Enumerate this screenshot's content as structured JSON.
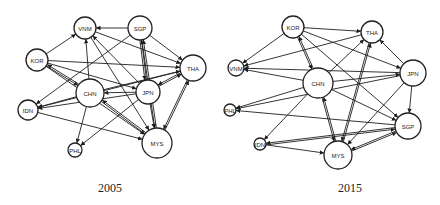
{
  "panels": [
    {
      "id": "p2005",
      "caption": "2005",
      "caption_pos": [
        110,
        192
      ],
      "nodes": [
        {
          "id": "VNM",
          "label": "VNM",
          "x": 85,
          "y": 28,
          "r": 11
        },
        {
          "id": "SGP",
          "label": "SGP",
          "x": 140,
          "y": 28,
          "r": 12
        },
        {
          "id": "KOR",
          "label": "KOR",
          "x": 37,
          "y": 60,
          "r": 11
        },
        {
          "id": "THA",
          "label": "THA",
          "x": 193,
          "y": 68,
          "r": 13
        },
        {
          "id": "CHN",
          "label": "CHN",
          "x": 90,
          "y": 93,
          "r": 14
        },
        {
          "id": "JPN",
          "label": "JPN",
          "x": 148,
          "y": 92,
          "r": 12
        },
        {
          "id": "IDN",
          "label": "IDN",
          "x": 28,
          "y": 110,
          "r": 10
        },
        {
          "id": "PHL",
          "label": "PHL",
          "x": 75,
          "y": 150,
          "r": 7
        },
        {
          "id": "MYS",
          "label": "MYS",
          "x": 157,
          "y": 143,
          "r": 15
        }
      ],
      "edges": [
        [
          "SGP",
          "VNM"
        ],
        [
          "KOR",
          "VNM"
        ],
        [
          "KOR",
          "THA"
        ],
        [
          "KOR",
          "CHN"
        ],
        [
          "KOR",
          "JPN"
        ],
        [
          "KOR",
          "MYS"
        ],
        [
          "CHN",
          "VNM"
        ],
        [
          "CHN",
          "THA"
        ],
        [
          "CHN",
          "IDN"
        ],
        [
          "CHN",
          "PHL"
        ],
        [
          "CHN",
          "MYS"
        ],
        [
          "CHN",
          "KOR"
        ],
        [
          "JPN",
          "CHN"
        ],
        [
          "JPN",
          "VNM"
        ],
        [
          "JPN",
          "SGP"
        ],
        [
          "JPN",
          "THA"
        ],
        [
          "JPN",
          "IDN"
        ],
        [
          "JPN",
          "PHL"
        ],
        [
          "JPN",
          "MYS"
        ],
        [
          "SGP",
          "THA"
        ],
        [
          "SGP",
          "MYS"
        ],
        [
          "SGP",
          "IDN"
        ],
        [
          "SGP",
          "JPN"
        ],
        [
          "VNM",
          "THA"
        ],
        [
          "VNM",
          "MYS"
        ],
        [
          "THA",
          "MYS"
        ],
        [
          "THA",
          "IDN"
        ],
        [
          "THA",
          "JPN"
        ],
        [
          "MYS",
          "THA"
        ],
        [
          "MYS",
          "SGP"
        ],
        [
          "IDN",
          "MYS"
        ],
        [
          "MYS",
          "CHN"
        ]
      ]
    },
    {
      "id": "p2015",
      "caption": "2015",
      "caption_pos": [
        350,
        192
      ],
      "nodes": [
        {
          "id": "KOR",
          "label": "KOR",
          "x": 293,
          "y": 27,
          "r": 11
        },
        {
          "id": "THA",
          "label": "THA",
          "x": 372,
          "y": 32,
          "r": 11
        },
        {
          "id": "VNM",
          "label": "VNM",
          "x": 236,
          "y": 68,
          "r": 8
        },
        {
          "id": "JPN",
          "label": "JPN",
          "x": 413,
          "y": 73,
          "r": 13
        },
        {
          "id": "CHN",
          "label": "CHN",
          "x": 318,
          "y": 83,
          "r": 15
        },
        {
          "id": "PHL",
          "label": "PHL",
          "x": 230,
          "y": 110,
          "r": 6
        },
        {
          "id": "SGP",
          "label": "SGP",
          "x": 408,
          "y": 126,
          "r": 13
        },
        {
          "id": "IDN",
          "label": "IDN",
          "x": 260,
          "y": 144,
          "r": 6
        },
        {
          "id": "MYS",
          "label": "MYS",
          "x": 338,
          "y": 155,
          "r": 14
        }
      ],
      "edges": [
        [
          "KOR",
          "THA"
        ],
        [
          "KOR",
          "VNM"
        ],
        [
          "KOR",
          "JPN"
        ],
        [
          "KOR",
          "SGP"
        ],
        [
          "KOR",
          "CHN"
        ],
        [
          "CHN",
          "KOR"
        ],
        [
          "CHN",
          "VNM"
        ],
        [
          "CHN",
          "THA"
        ],
        [
          "CHN",
          "JPN"
        ],
        [
          "CHN",
          "PHL"
        ],
        [
          "CHN",
          "IDN"
        ],
        [
          "CHN",
          "MYS"
        ],
        [
          "CHN",
          "SGP"
        ],
        [
          "JPN",
          "VNM"
        ],
        [
          "JPN",
          "THA"
        ],
        [
          "JPN",
          "PHL"
        ],
        [
          "JPN",
          "MYS"
        ],
        [
          "JPN",
          "SGP"
        ],
        [
          "THA",
          "VNM"
        ],
        [
          "THA",
          "MYS"
        ],
        [
          "MYS",
          "THA"
        ],
        [
          "SGP",
          "PHL"
        ],
        [
          "SGP",
          "IDN"
        ],
        [
          "SGP",
          "MYS"
        ],
        [
          "IDN",
          "MYS"
        ],
        [
          "IDN",
          "SGP"
        ],
        [
          "MYS",
          "SGP"
        ],
        [
          "MYS",
          "CHN"
        ]
      ]
    }
  ]
}
